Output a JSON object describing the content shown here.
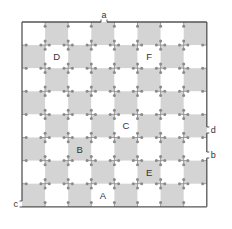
{
  "board": {
    "rows": 8,
    "cols": 8,
    "origin_x": 22,
    "origin_y": 22,
    "cell_size": 23.1,
    "colors": {
      "dark_cell": "#d4d4d4",
      "light_cell": "#ffffff",
      "border": "#555555",
      "node": "#8a8a8a",
      "label": "#333333"
    },
    "dark_when_parity": 1
  },
  "cell_labels": [
    {
      "text": "D",
      "row": 1,
      "col": 1
    },
    {
      "text": "F",
      "row": 1,
      "col": 5
    },
    {
      "text": "C",
      "row": 4,
      "col": 4
    },
    {
      "text": "B",
      "row": 5,
      "col": 2
    },
    {
      "text": "E",
      "row": 6,
      "col": 5
    },
    {
      "text": "A",
      "row": 7,
      "col": 3
    }
  ],
  "edge_markers": [
    {
      "text": "a",
      "side": "top",
      "pos": 104
    },
    {
      "text": "d",
      "side": "right",
      "pos": 130
    },
    {
      "text": "b",
      "side": "right",
      "pos": 155
    },
    {
      "text": "c",
      "side": "left",
      "pos": 204
    }
  ]
}
